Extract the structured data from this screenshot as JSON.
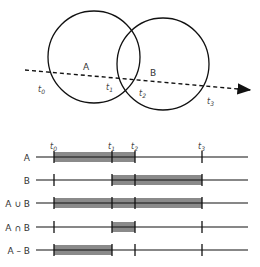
{
  "venn": {
    "circle_a_label": "A",
    "circle_b_label": "B",
    "ray_points": [
      {
        "label": "t",
        "sub": "0"
      },
      {
        "label": "t",
        "sub": "1"
      },
      {
        "label": "t",
        "sub": "2"
      },
      {
        "label": "t",
        "sub": "3"
      }
    ]
  },
  "timeline": {
    "tick_labels": [
      {
        "label": "t",
        "sub": "0"
      },
      {
        "label": "t",
        "sub": "1"
      },
      {
        "label": "t",
        "sub": "2"
      },
      {
        "label": "t",
        "sub": "3"
      }
    ],
    "rows": [
      {
        "label": "A",
        "intervals": [
          [
            "t0",
            "t2"
          ]
        ]
      },
      {
        "label": "B",
        "intervals": [
          [
            "t1",
            "t3"
          ]
        ]
      },
      {
        "label": "A ∪ B",
        "intervals": [
          [
            "t0",
            "t3"
          ]
        ]
      },
      {
        "label": "A ∩ B",
        "intervals": [
          [
            "t1",
            "t2"
          ]
        ]
      },
      {
        "label": "A – B",
        "intervals": [
          [
            "t0",
            "t1"
          ]
        ]
      }
    ]
  },
  "colors": {
    "stroke": "#111111",
    "fill": "#8a8a8a"
  }
}
